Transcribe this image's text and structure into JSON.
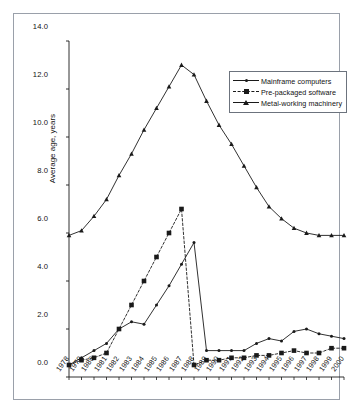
{
  "chart_data": {
    "type": "line",
    "title": "",
    "xlabel": "",
    "ylabel": "Average age, years",
    "ylim": [
      0.0,
      14.0
    ],
    "yticks": [
      "0.0",
      "2.0",
      "4.0",
      "6.0",
      "8.0",
      "10.0",
      "12.0",
      "14.0"
    ],
    "ytick_values": [
      0.0,
      2.0,
      4.0,
      6.0,
      8.0,
      10.0,
      12.0,
      14.0
    ],
    "grid": false,
    "legend_position": "top-right",
    "x": [
      1978,
      1979,
      1980,
      1981,
      1982,
      1983,
      1984,
      1985,
      1986,
      1987,
      1988,
      1989,
      1990,
      1991,
      1992,
      1993,
      1994,
      1995,
      1996,
      1997,
      1998,
      1999,
      2000
    ],
    "categories": [
      "1978",
      "1979",
      "1980",
      "1981",
      "1982",
      "1983",
      "1984",
      "1985",
      "1986",
      "1987",
      "1988",
      "1989",
      "1990",
      "1991",
      "1992",
      "1993",
      "1994",
      "1995",
      "1996",
      "1997",
      "1998",
      "1999",
      "2000"
    ],
    "series": [
      {
        "name": "Mainframe computers",
        "marker": "dot",
        "linestyle": "solid",
        "color": "#1a1a1a",
        "values": [
          0.5,
          0.8,
          1.1,
          1.4,
          2.0,
          2.3,
          2.2,
          3.0,
          3.8,
          4.7,
          5.6,
          1.1,
          1.1,
          1.1,
          1.1,
          1.4,
          1.6,
          1.5,
          1.9,
          2.0,
          1.8,
          1.7,
          1.6
        ]
      },
      {
        "name": "Pre-packaged software",
        "marker": "square",
        "linestyle": "dashed",
        "color": "#1a1a1a",
        "values": [
          0.5,
          0.7,
          0.8,
          1.0,
          2.0,
          3.0,
          4.0,
          5.0,
          6.0,
          7.0,
          0.5,
          0.7,
          0.7,
          0.8,
          0.8,
          0.9,
          0.9,
          1.0,
          1.1,
          1.0,
          1.0,
          1.2,
          1.2
        ]
      },
      {
        "name": "Metal-working machinery",
        "marker": "triangle",
        "linestyle": "solid",
        "color": "#1a1a1a",
        "values": [
          5.9,
          6.1,
          6.7,
          7.4,
          8.4,
          9.3,
          10.3,
          11.2,
          12.1,
          13.0,
          12.6,
          11.5,
          10.5,
          9.7,
          8.8,
          7.9,
          7.1,
          6.6,
          6.2,
          6.0,
          5.9,
          5.9,
          5.9
        ]
      }
    ]
  },
  "legend": {
    "items": [
      {
        "label": "Mainframe computers"
      },
      {
        "label": "Pre-packaged software"
      },
      {
        "label": "Metal-working machinery"
      }
    ]
  }
}
